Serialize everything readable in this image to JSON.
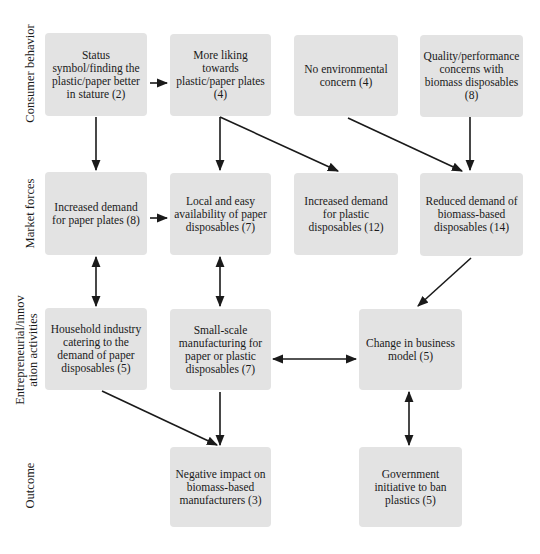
{
  "diagram": {
    "row_labels": [
      "Consumer behavior",
      "Market forces",
      "Entrepreneurial/innovation activities",
      "Outcome"
    ],
    "row_label_lines": {
      "entrepreneurial_line1": "Entrepreneurial/innov",
      "entrepreneurial_line2": "ation activities"
    },
    "nodes": {
      "status_symbol": "Status symbol/finding the plastic/paper better in stature (2)",
      "more_liking": "More liking towards plastic/paper plates (4)",
      "no_env_concern": "No environmental concern (4)",
      "quality_concerns": "Quality/performance concerns with biomass disposables (8)",
      "inc_demand_paper": "Increased demand for paper plates (8)",
      "local_availability": "Local and easy availability of paper disposables (7)",
      "inc_demand_plastic": "Increased demand for plastic disposables (12)",
      "reduced_demand_biomass": "Reduced demand of biomass-based disposables (14)",
      "household_industry": "Household industry catering to the demand of paper disposables (5)",
      "small_scale": "Small-scale manufacturing for paper or plastic disposables (7)",
      "change_business": "Change in business model (5)",
      "negative_impact": "Negative impact on biomass-based manufacturers (3)",
      "gov_initiative": "Government initiative to ban plastics (5)"
    },
    "edges": [
      {
        "from": "status_symbol",
        "to": "more_liking",
        "type": "directed"
      },
      {
        "from": "status_symbol",
        "to": "inc_demand_paper",
        "type": "directed"
      },
      {
        "from": "more_liking",
        "to": "local_availability",
        "type": "directed"
      },
      {
        "from": "more_liking",
        "to": "inc_demand_plastic",
        "type": "directed"
      },
      {
        "from": "no_env_concern",
        "to": "reduced_demand_biomass",
        "type": "directed"
      },
      {
        "from": "quality_concerns",
        "to": "reduced_demand_biomass",
        "type": "directed"
      },
      {
        "from": "inc_demand_paper",
        "to": "local_availability",
        "type": "directed"
      },
      {
        "from": "inc_demand_paper",
        "to": "household_industry",
        "type": "bidirectional"
      },
      {
        "from": "local_availability",
        "to": "small_scale",
        "type": "bidirectional"
      },
      {
        "from": "reduced_demand_biomass",
        "to": "change_business",
        "type": "directed"
      },
      {
        "from": "small_scale",
        "to": "change_business",
        "type": "bidirectional"
      },
      {
        "from": "household_industry",
        "to": "negative_impact",
        "type": "directed"
      },
      {
        "from": "small_scale",
        "to": "negative_impact",
        "type": "directed"
      },
      {
        "from": "change_business",
        "to": "gov_initiative",
        "type": "bidirectional"
      }
    ],
    "colors": {
      "box_fill": "#e3e3e3",
      "arrow": "#1a1a1a",
      "background": "#ffffff"
    }
  }
}
